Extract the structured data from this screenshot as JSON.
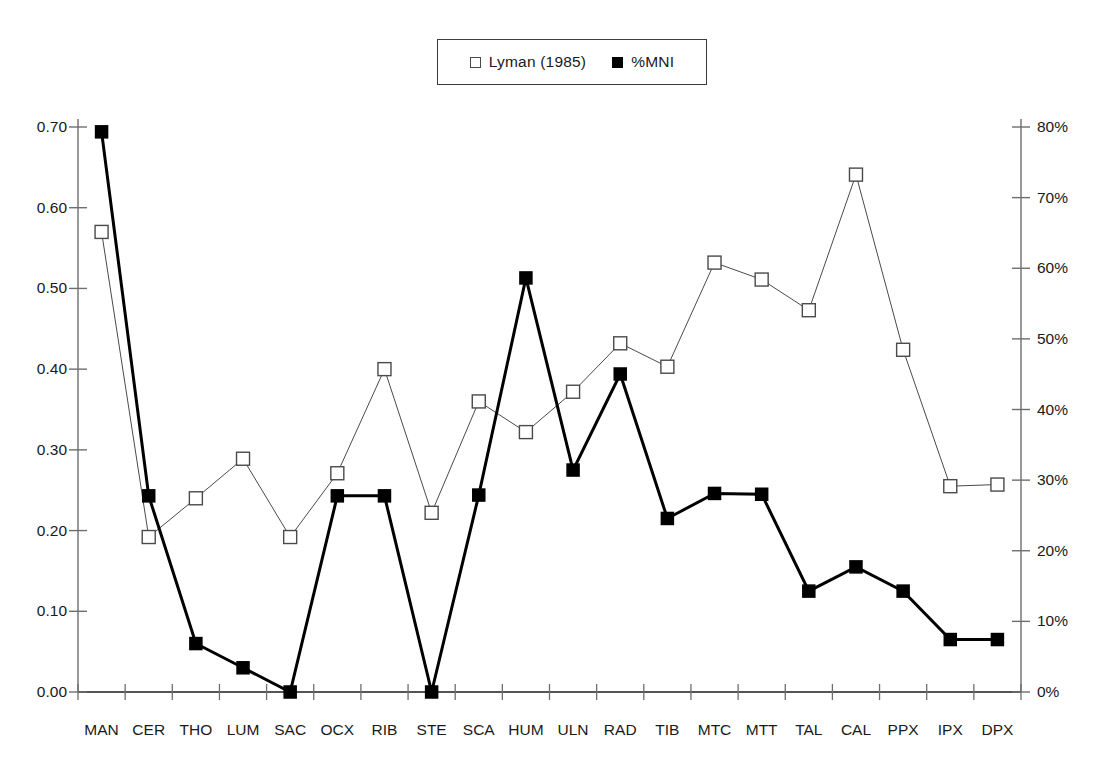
{
  "legend": {
    "position": "top-center",
    "entries": [
      {
        "label": "Lyman (1985)",
        "marker": "open-square-marker"
      },
      {
        "label": "%MNI",
        "marker": "filled-square-marker"
      }
    ]
  },
  "chart_data": {
    "type": "line",
    "title": "",
    "xlabel": "",
    "ylabel": "",
    "grid": false,
    "categories": [
      "MAN",
      "CER",
      "THO",
      "LUM",
      "SAC",
      "OCX",
      "RIB",
      "STE",
      "SCA",
      "HUM",
      "ULN",
      "RAD",
      "TIB",
      "MTC",
      "MTT",
      "TAL",
      "CAL",
      "PPX",
      "IPX",
      "DPX"
    ],
    "axes": {
      "left": {
        "label": "",
        "ylim": [
          0.0,
          0.7
        ],
        "ticks": [
          0.0,
          0.1,
          0.2,
          0.3,
          0.4,
          0.5,
          0.6,
          0.7
        ],
        "ticklabels": [
          "0.00",
          "0.10",
          "0.20",
          "0.30",
          "0.40",
          "0.50",
          "0.60",
          "0.70"
        ],
        "series": "Lyman (1985)"
      },
      "right": {
        "label": "",
        "ylim": [
          0,
          80
        ],
        "ticks": [
          0,
          10,
          20,
          30,
          40,
          50,
          60,
          70,
          80
        ],
        "ticklabels": [
          "0%",
          "10%",
          "20%",
          "30%",
          "40%",
          "50%",
          "60%",
          "70%",
          "80%"
        ],
        "series": "%MNI"
      }
    },
    "series": [
      {
        "name": "Lyman (1985)",
        "axis": "left",
        "marker": "open-square",
        "color": "#4a4a4a",
        "linewidth": 1,
        "values": [
          0.57,
          0.192,
          0.24,
          0.289,
          0.192,
          0.271,
          0.4,
          0.222,
          0.36,
          0.322,
          0.372,
          0.432,
          0.403,
          0.532,
          0.511,
          0.473,
          0.641,
          0.424,
          0.255,
          0.257
        ]
      },
      {
        "name": "%MNI",
        "axis": "right",
        "marker": "filled-square",
        "color": "#000000",
        "linewidth": 3,
        "values_left_scale": [
          0.694,
          0.243,
          0.06,
          0.03,
          0.0,
          0.243,
          0.243,
          0.0,
          0.244,
          0.513,
          0.275,
          0.394,
          0.215,
          0.246,
          0.245,
          0.125,
          0.155,
          0.125,
          0.065,
          0.065
        ],
        "values": [
          79.3,
          27.8,
          6.9,
          3.4,
          0.0,
          27.8,
          27.8,
          0.0,
          27.9,
          58.6,
          31.4,
          45.0,
          24.6,
          28.1,
          28.0,
          14.3,
          17.7,
          14.3,
          7.4,
          7.4
        ]
      }
    ]
  }
}
